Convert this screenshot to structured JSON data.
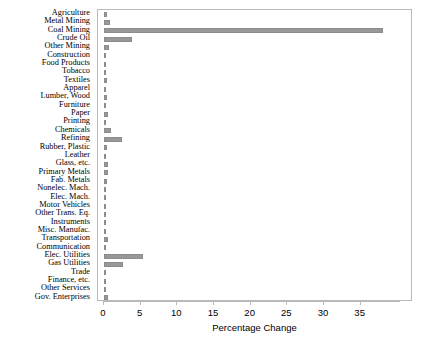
{
  "chart_data": {
    "type": "bar",
    "orientation": "horizontal",
    "title": "",
    "xlabel": "Percentage Change",
    "ylabel": "",
    "xlim": [
      0,
      40.5
    ],
    "ylim": null,
    "grid": false,
    "legend": null,
    "bar_color": "#989898",
    "frame_color": "#b9b9b9",
    "xticks": [
      0,
      5,
      10,
      15,
      20,
      25,
      30,
      35
    ],
    "xtick_labels": [
      "0",
      "5",
      "10",
      "15",
      "20",
      "25",
      "30",
      "35"
    ],
    "categories": [
      "Agriculture",
      "Metal Mining",
      "Coal Mining",
      "Crude Oil",
      "Other Mining",
      "Construction",
      "Food Products",
      "Tobacco",
      "Textiles",
      "Apparel",
      "Lumber, Wood",
      "Furniture",
      "Paper",
      "Printing",
      "Chemicals",
      "Refining",
      "Rubber, Plastic",
      "Leather",
      "Glass, etc.",
      "Primary Metals",
      "Fab. Metals",
      "Nonelec. Mach.",
      "Elec. Mach.",
      "Motor Vehicles",
      "Other Trans. Eq.",
      "Instruments",
      "Misc. Manufac.",
      "Transportation",
      "Communication",
      "Elec. Utilities",
      "Gas Utilities",
      "Trade",
      "Finance, etc.",
      "Other Services",
      "Gov. Enterprises"
    ],
    "values": [
      0.45,
      0.75,
      38.1,
      3.85,
      0.65,
      0.3,
      0.3,
      0.2,
      0.4,
      0.3,
      0.45,
      0.3,
      0.5,
      0.3,
      1.0,
      2.45,
      0.4,
      0.15,
      0.6,
      0.55,
      0.4,
      0.3,
      0.3,
      0.3,
      0.3,
      0.25,
      0.3,
      0.5,
      0.3,
      5.35,
      2.65,
      0.3,
      0.3,
      0.3,
      0.55
    ]
  }
}
